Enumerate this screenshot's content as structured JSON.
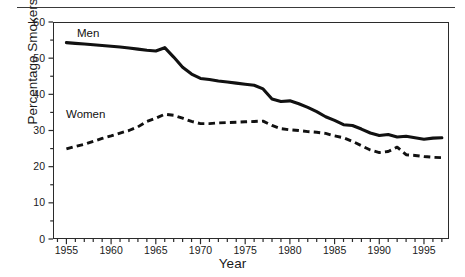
{
  "figure": {
    "axis_title_x": "Year",
    "axis_title_y": "Percentage Smokers",
    "y_tick_labels": [
      "60",
      "50",
      "40",
      "30",
      "20",
      "10",
      "0"
    ],
    "x_tick_labels": [
      "1955",
      "1960",
      "1965",
      "1970",
      "1975",
      "1980",
      "1985",
      "1990",
      "1995"
    ],
    "series_labels": {
      "men": "Men",
      "women": "Women"
    },
    "colors": {
      "line": "#111111",
      "axis": "#2b2b2b",
      "rule": "#3a3a3a",
      "background": "#ffffff"
    }
  },
  "chart_data": {
    "type": "line",
    "title": "",
    "subtitle": "",
    "xlabel": "Year",
    "ylabel": "Percentage Smokers",
    "xlim": [
      1953.5,
      1997.8
    ],
    "ylim": [
      0,
      60
    ],
    "yticks": [
      0,
      10,
      20,
      30,
      40,
      50,
      60
    ],
    "xticks": [
      1955,
      1960,
      1965,
      1970,
      1975,
      1980,
      1985,
      1990,
      1995
    ],
    "x_minor_tick_interval": 1,
    "grid": false,
    "legend": "inline-labels",
    "annotations": [
      {
        "text": "Men",
        "x": 1957.5,
        "y": 57.5
      },
      {
        "text": "Women",
        "x": 1956.0,
        "y": 37.0
      }
    ],
    "x": [
      1955,
      1956,
      1957,
      1958,
      1959,
      1960,
      1961,
      1962,
      1963,
      1964,
      1965,
      1966,
      1967,
      1968,
      1969,
      1970,
      1971,
      1972,
      1973,
      1974,
      1975,
      1976,
      1977,
      1978,
      1979,
      1980,
      1981,
      1982,
      1983,
      1984,
      1985,
      1986,
      1987,
      1988,
      1989,
      1990,
      1991,
      1992,
      1993,
      1994,
      1995,
      1996,
      1997
    ],
    "series": [
      {
        "name": "Men",
        "style": "solid",
        "values": [
          54.3,
          54.1,
          53.9,
          53.7,
          53.5,
          53.3,
          53.1,
          52.8,
          52.5,
          52.2,
          52.0,
          52.9,
          50.3,
          47.5,
          45.6,
          44.4,
          44.1,
          43.7,
          43.4,
          43.1,
          42.8,
          42.5,
          41.5,
          38.7,
          38.0,
          38.2,
          37.4,
          36.4,
          35.2,
          33.8,
          32.8,
          31.6,
          31.4,
          30.4,
          29.3,
          28.6,
          28.9,
          28.2,
          28.4,
          28.0,
          27.6,
          27.9,
          28.0
        ]
      },
      {
        "name": "Women",
        "style": "dashed",
        "values": [
          24.9,
          25.6,
          26.2,
          27.0,
          27.8,
          28.5,
          29.3,
          30.0,
          31.0,
          32.5,
          33.4,
          34.5,
          34.2,
          33.4,
          32.5,
          31.9,
          31.9,
          32.1,
          32.2,
          32.3,
          32.4,
          32.5,
          32.6,
          31.4,
          30.5,
          30.2,
          30.0,
          29.7,
          29.5,
          29.2,
          28.5,
          28.0,
          27.0,
          25.8,
          24.6,
          23.9,
          24.2,
          25.4,
          23.3,
          23.1,
          22.8,
          22.6,
          22.5
        ]
      }
    ]
  }
}
